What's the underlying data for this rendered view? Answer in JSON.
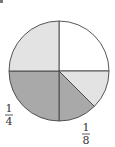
{
  "chart_data": {
    "type": "pie",
    "title": "",
    "start_angle_deg": 90,
    "direction": "clockwise",
    "slices": [
      {
        "name": "top-right-quarter",
        "fraction": 0.25,
        "color": "#ffffff",
        "label": ""
      },
      {
        "name": "right-eighth-light",
        "fraction": 0.125,
        "color": "#e3e3e3",
        "label": ""
      },
      {
        "name": "bottom-right-eighth",
        "fraction": 0.125,
        "color": "#a9a9a9",
        "label": {
          "numerator": "1",
          "denominator": "8"
        }
      },
      {
        "name": "bottom-left-quarter",
        "fraction": 0.25,
        "color": "#a9a9a9",
        "label": {
          "numerator": "1",
          "denominator": "4"
        }
      },
      {
        "name": "top-left-quarter",
        "fraction": 0.25,
        "color": "#e3e3e3",
        "label": ""
      }
    ],
    "outline_color": "#444444"
  }
}
